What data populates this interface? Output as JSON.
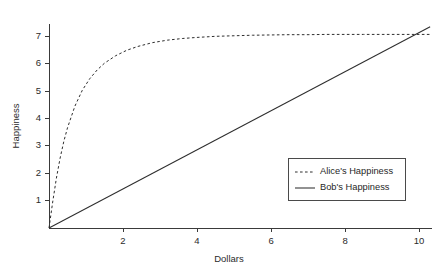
{
  "chart_data": {
    "type": "line",
    "title": "",
    "xlabel": "Dollars",
    "ylabel": "Happiness",
    "xlim": [
      0,
      10.35
    ],
    "ylim": [
      0,
      7.45
    ],
    "grid": false,
    "legend_position": "lower-right",
    "xticks": [
      2,
      4,
      6,
      8,
      10
    ],
    "xtick_labels": [
      "2",
      "4",
      "6",
      "8",
      "10"
    ],
    "yticks": [
      1,
      2,
      3,
      4,
      5,
      6,
      7
    ],
    "ytick_labels": [
      "1",
      "2",
      "3",
      "4",
      "5",
      "6",
      "7"
    ],
    "series": [
      {
        "name": "Alice's Happiness",
        "style": "dashed",
        "color": "#2e2e2e",
        "x": [
          0,
          0.1,
          0.2,
          0.3,
          0.4,
          0.5,
          0.7,
          0.9,
          1.1,
          1.3,
          1.5,
          1.8,
          2.1,
          2.4,
          2.8,
          3.2,
          3.6,
          4.0,
          4.5,
          5.0,
          5.5,
          6.0,
          6.5,
          7.0,
          7.5,
          8.0,
          8.5,
          9.0,
          9.5,
          10.0,
          10.3
        ],
        "values": [
          0,
          0.95,
          1.82,
          2.55,
          3.16,
          3.66,
          4.45,
          5.03,
          5.45,
          5.77,
          6.02,
          6.29,
          6.49,
          6.63,
          6.77,
          6.86,
          6.92,
          6.96,
          7.0,
          7.02,
          7.04,
          7.05,
          7.06,
          7.06,
          7.07,
          7.07,
          7.07,
          7.07,
          7.07,
          7.07,
          7.07
        ]
      },
      {
        "name": "Bob's Happiness",
        "style": "solid",
        "color": "#2e2e2e",
        "x": [
          0,
          10.3
        ],
        "values": [
          0,
          7.35
        ]
      }
    ],
    "legend_entries": [
      {
        "label": "Alice's Happiness",
        "style": "dashed"
      },
      {
        "label": "Bob's Happiness",
        "style": "solid"
      }
    ]
  }
}
